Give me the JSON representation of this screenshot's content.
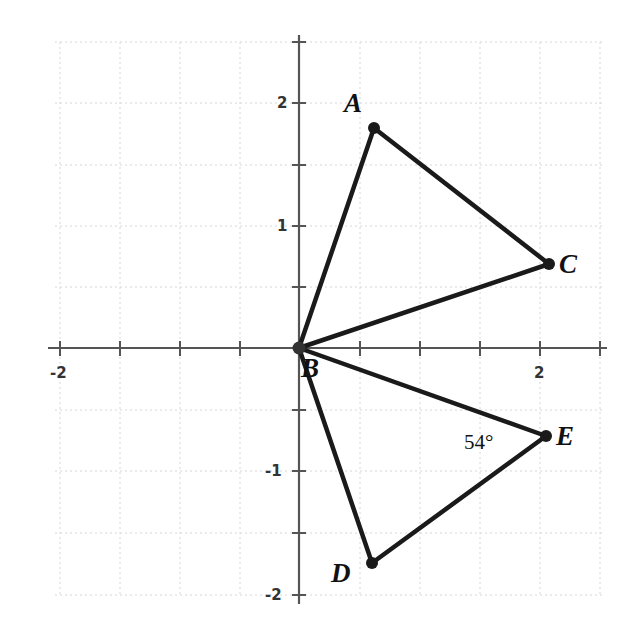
{
  "diagram": {
    "type": "coordinate-plane-geometry",
    "axes": {
      "x_range": [
        -2.0,
        2.5
      ],
      "y_range": [
        -2.1,
        2.5
      ],
      "x_tick_step": 0.5,
      "y_tick_step": 0.5,
      "x_labels": [
        {
          "value": -2,
          "text": "-2"
        },
        {
          "value": 2,
          "text": "2"
        }
      ],
      "y_labels": [
        {
          "value": 2,
          "text": "2"
        },
        {
          "value": 1,
          "text": "1"
        },
        {
          "value": -1,
          "text": "-1"
        },
        {
          "value": -2,
          "text": "-2"
        }
      ],
      "grid": true
    },
    "points": [
      {
        "name": "A",
        "x": 0.62,
        "y": 1.8
      },
      {
        "name": "B",
        "x": 0.0,
        "y": 0.0
      },
      {
        "name": "C",
        "x": 2.08,
        "y": 0.69
      },
      {
        "name": "D",
        "x": 0.6,
        "y": -1.77
      },
      {
        "name": "E",
        "x": 2.05,
        "y": -0.72
      }
    ],
    "segments": [
      [
        "B",
        "A"
      ],
      [
        "A",
        "C"
      ],
      [
        "C",
        "B"
      ],
      [
        "B",
        "E"
      ],
      [
        "E",
        "D"
      ],
      [
        "D",
        "B"
      ]
    ],
    "triangles": [
      [
        "A",
        "B",
        "C"
      ],
      [
        "D",
        "B",
        "E"
      ]
    ],
    "annotations": [
      {
        "text": "54°",
        "at": "E",
        "meaning": "angle BED"
      }
    ],
    "colors": {
      "line": "#1a1a1a",
      "axis": "#555555",
      "grid": "#d8d8d8"
    }
  },
  "labels": {
    "A": "A",
    "B": "B",
    "C": "C",
    "D": "D",
    "E": "E",
    "angle": "54°",
    "x_neg2": "-2",
    "x_2": "2",
    "y_2": "2",
    "y_1": "1",
    "y_neg1": "-1",
    "y_neg2": "-2"
  }
}
